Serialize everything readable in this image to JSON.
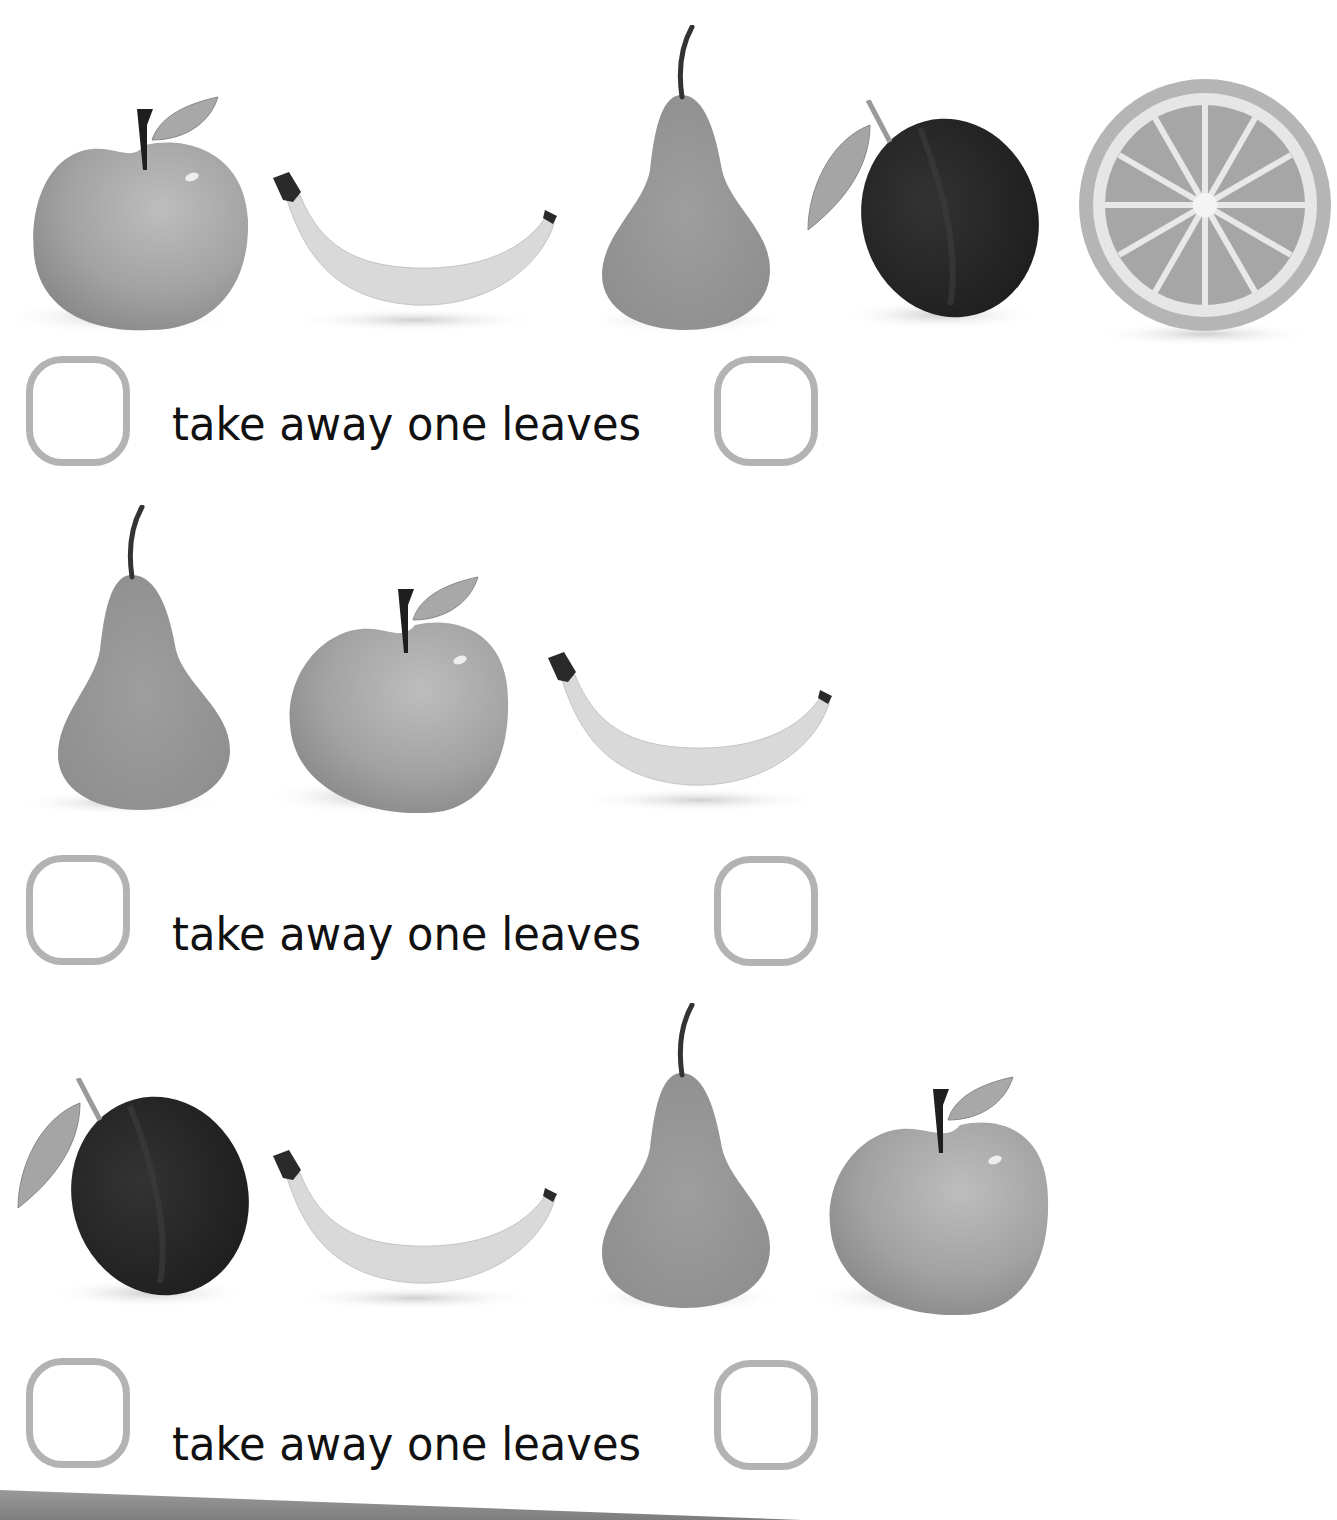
{
  "worksheet": {
    "colors": {
      "box_border": "#b3b3b3",
      "text": "#111111"
    },
    "problems": [
      {
        "fruits": [
          "apple",
          "banana",
          "pear",
          "plum",
          "orange-slice"
        ],
        "left_box_value": "",
        "phrase": "take away one leaves",
        "right_box_value": ""
      },
      {
        "fruits": [
          "pear",
          "apple",
          "banana"
        ],
        "left_box_value": "",
        "phrase": "take away one leaves",
        "right_box_value": ""
      },
      {
        "fruits": [
          "plum",
          "banana",
          "pear",
          "apple"
        ],
        "left_box_value": "",
        "phrase": "take away one leaves",
        "right_box_value": ""
      }
    ]
  }
}
